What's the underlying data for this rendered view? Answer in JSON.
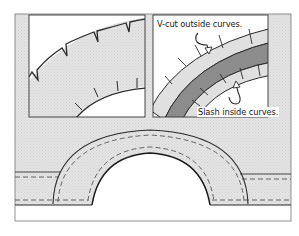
{
  "diagram": {
    "type": "illustration",
    "colors": {
      "fabric_shade": "#e3e3e3",
      "dark_band": "#8c8c8c",
      "outline": "#2a2a2a",
      "background": "#ffffff"
    },
    "annotations": {
      "vcut": "V-cut outside curves.",
      "slash": "Slash inside curves."
    },
    "panels": [
      {
        "id": "left-inset",
        "content": "Close-up of curved edge with V-notches on outer curve and slashes on inner curve"
      },
      {
        "id": "right-inset",
        "content": "Close-up of folded seam allowance with V-cuts on outside curve and slashes on inside curve"
      },
      {
        "id": "bottom-main",
        "content": "Arch-shaped band with dashed stitching lines"
      }
    ]
  }
}
